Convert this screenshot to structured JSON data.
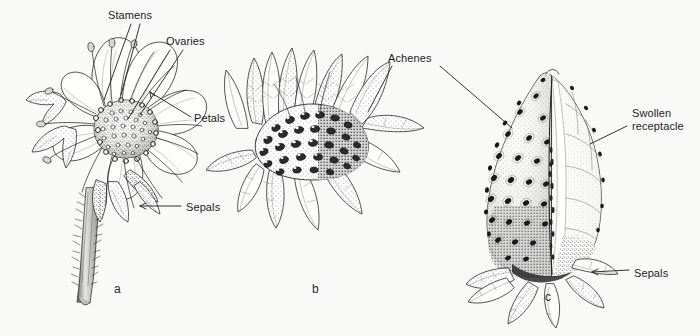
{
  "figure": {
    "background_color": "#f9f9f7",
    "ink_color": "#1c1c1c",
    "width": 700,
    "height": 336
  },
  "labels": [
    {
      "id": "stamens",
      "text": "Stamens",
      "x": 108,
      "y": 9,
      "panel": "a"
    },
    {
      "id": "ovaries",
      "text": "Ovaries",
      "x": 166,
      "y": 35,
      "panel": "a"
    },
    {
      "id": "petals",
      "text": "Petals",
      "x": 194,
      "y": 112,
      "panel": "a"
    },
    {
      "id": "sepals-a",
      "text": "Sepals",
      "x": 186,
      "y": 201,
      "panel": "a"
    },
    {
      "id": "achenes",
      "text": "Achenes",
      "x": 388,
      "y": 52,
      "panel": "b"
    },
    {
      "id": "swollen-receptacle",
      "text": "Swollen\nreceptacle",
      "x": 632,
      "y": 107,
      "panel": "c"
    },
    {
      "id": "sepals-c",
      "text": "Sepals",
      "x": 634,
      "y": 267,
      "panel": "c"
    }
  ],
  "panels": [
    {
      "id": "a",
      "letter": "a",
      "x": 114,
      "y": 282,
      "caption": "Open flower with stamens, ovaries, petals and sepals"
    },
    {
      "id": "b",
      "letter": "b",
      "x": 312,
      "y": 282,
      "caption": "Developing fruit showing achenes on enlarging receptacle"
    },
    {
      "id": "c",
      "letter": "c",
      "x": 545,
      "y": 290,
      "caption": "Mature strawberry, cut away to show swollen receptacle"
    }
  ],
  "leader_lines": [
    {
      "id": "stamens-line-1",
      "from": [
        131,
        24
      ],
      "to": [
        104,
        100
      ]
    },
    {
      "id": "stamens-line-2",
      "from": [
        140,
        24
      ],
      "to": [
        121,
        95
      ]
    },
    {
      "id": "ovaries-line-1",
      "from": [
        170,
        50
      ],
      "to": [
        128,
        119
      ]
    },
    {
      "id": "ovaries-line-2",
      "from": [
        183,
        50
      ],
      "to": [
        140,
        115
      ]
    },
    {
      "id": "petals-line",
      "from": [
        191,
        117
      ],
      "to": [
        150,
        92
      ]
    },
    {
      "id": "sepals-a-line",
      "from": [
        183,
        206
      ],
      "to": [
        140,
        206
      ]
    },
    {
      "id": "achenes-line-b",
      "from": [
        392,
        66
      ],
      "to": [
        368,
        110
      ]
    },
    {
      "id": "achenes-line-c",
      "from": [
        438,
        66
      ],
      "to": [
        512,
        128
      ]
    },
    {
      "id": "swollen-line",
      "from": [
        629,
        125
      ],
      "to": [
        592,
        143
      ]
    },
    {
      "id": "sepals-c-line",
      "from": [
        631,
        270
      ],
      "to": [
        594,
        272
      ]
    }
  ]
}
